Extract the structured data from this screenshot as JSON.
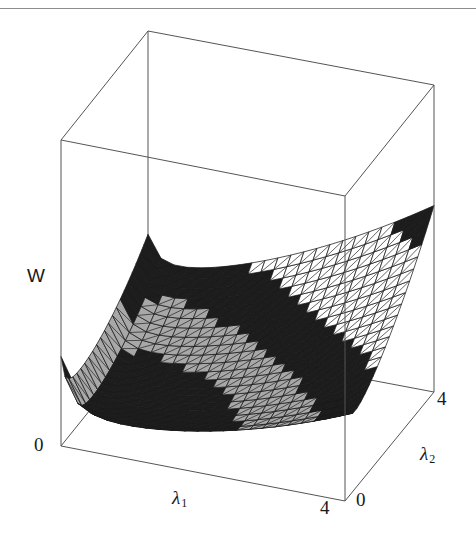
{
  "figure": {
    "kind": "3d-surface-plot",
    "width": 476,
    "height": 550,
    "background": "#ffffff",
    "frame_color": "#555555",
    "mesh_color": "#1a1a1a",
    "scan_rule_y": 8,
    "scan_rule_color": "#8d8d8d"
  },
  "labels": {
    "vertical_axis": "W",
    "x_axis": "λ",
    "x_axis_sub": "1",
    "y_axis": "λ",
    "y_axis_sub": "2",
    "origin_tick": "0",
    "x_max_tick": "4",
    "y_min_tick": "0",
    "y_max_tick": "4"
  },
  "chart_data": {
    "type": "surface",
    "title": "",
    "xlabel": "λ1",
    "ylabel": "λ2",
    "zlabel": "W",
    "xlim": [
      0,
      4
    ],
    "ylim": [
      0,
      4
    ],
    "xticks": [
      "0",
      "4"
    ],
    "yticks": [
      "0",
      "4"
    ],
    "zticks": [
      "0"
    ],
    "grid": false,
    "legend": "none",
    "mesh_nx": 22,
    "mesh_ny": 22,
    "shading": "banded-grayscale",
    "band_colors": [
      "#ffffff",
      "#1a1a1a",
      "#a8a8a8",
      "#ffffff",
      "#1a1a1a",
      "#a8a8a8"
    ],
    "x": [
      0.0,
      0.4,
      0.8,
      1.2,
      1.6,
      2.0,
      2.4,
      2.8,
      3.2,
      3.6,
      4.0
    ],
    "y": [
      0.0,
      0.4,
      0.8,
      1.2,
      1.6,
      2.0,
      2.4,
      2.8,
      3.2,
      3.6,
      4.0
    ],
    "z": [
      [
        10.0,
        9.7,
        9.5,
        9.4,
        9.4,
        9.5,
        9.7,
        10.0,
        10.5,
        11.1,
        11.8
      ],
      [
        4.2,
        3.8,
        3.5,
        3.4,
        3.4,
        3.6,
        3.9,
        4.4,
        5.1,
        6.0,
        7.1
      ],
      [
        2.1,
        1.7,
        1.4,
        1.3,
        1.4,
        1.6,
        2.0,
        2.6,
        3.5,
        4.6,
        6.0
      ],
      [
        1.2,
        0.8,
        0.6,
        0.5,
        0.6,
        0.9,
        1.4,
        2.1,
        3.1,
        4.4,
        6.0
      ],
      [
        0.9,
        0.5,
        0.3,
        0.2,
        0.4,
        0.8,
        1.4,
        2.3,
        3.4,
        4.9,
        6.7
      ],
      [
        0.9,
        0.5,
        0.3,
        0.3,
        0.5,
        1.0,
        1.8,
        2.8,
        4.2,
        5.9,
        7.9
      ],
      [
        1.2,
        0.8,
        0.6,
        0.6,
        0.9,
        1.5,
        2.4,
        3.6,
        5.2,
        7.2,
        9.5
      ],
      [
        1.8,
        1.4,
        1.2,
        1.3,
        1.7,
        2.4,
        3.4,
        4.8,
        6.6,
        8.9,
        11.6
      ],
      [
        2.7,
        2.3,
        2.1,
        2.3,
        2.8,
        3.6,
        4.8,
        6.4,
        8.5,
        11.0,
        14.1
      ],
      [
        3.9,
        3.5,
        3.4,
        3.6,
        4.2,
        5.2,
        6.6,
        8.4,
        10.7,
        13.6,
        17.0
      ],
      [
        5.4,
        5.0,
        4.9,
        5.2,
        5.9,
        7.0,
        8.6,
        10.7,
        13.3,
        16.5,
        20.3
      ]
    ]
  }
}
